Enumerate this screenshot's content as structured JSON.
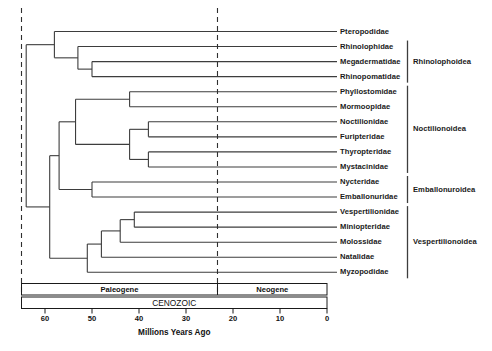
{
  "figure": {
    "axis_title": "Millions Years Ago",
    "era_label": "CENOZOIC",
    "epochs": [
      {
        "name": "Paleogene",
        "start_mya": 65,
        "end_mya": 23.3
      },
      {
        "name": "Neogene",
        "start_mya": 23.3,
        "end_mya": 0
      }
    ],
    "tick_labels": [
      "60",
      "50",
      "40",
      "30",
      "20",
      "10",
      "0"
    ],
    "boundary_lines_mya": [
      65,
      23.3
    ]
  },
  "taxa": [
    {
      "name": "Pteropodidae",
      "clade": ""
    },
    {
      "name": "Rhinolophidae",
      "clade": "Rhinolophoidea"
    },
    {
      "name": "Megadermatidae",
      "clade": "Rhinolophoidea"
    },
    {
      "name": "Rhinopomatidae",
      "clade": "Rhinolophoidea"
    },
    {
      "name": "Phyllostomidae",
      "clade": "Noctilionoidea"
    },
    {
      "name": "Mormoopidae",
      "clade": "Noctilionoidea"
    },
    {
      "name": "Noctilionidae",
      "clade": "Noctilionoidea"
    },
    {
      "name": "Furipteridae",
      "clade": "Noctilionoidea"
    },
    {
      "name": "Thyropteridae",
      "clade": "Noctilionoidea"
    },
    {
      "name": "Mystacinidae",
      "clade": "Noctilionoidea"
    },
    {
      "name": "Nycteridae",
      "clade": "Emballonuroidea"
    },
    {
      "name": "Emballonuridae",
      "clade": "Emballonuroidea"
    },
    {
      "name": "Vespertilionidae",
      "clade": "Vespertilionoidea"
    },
    {
      "name": "Miniopteridae",
      "clade": "Vespertilionoidea"
    },
    {
      "name": "Molossidae",
      "clade": "Vespertilionoidea"
    },
    {
      "name": "Natalidae",
      "clade": "Vespertilionoidea"
    },
    {
      "name": "Myzopodidae",
      "clade": "Vespertilionoidea"
    }
  ],
  "clades": [
    {
      "label": "Rhinolophoidea",
      "first_taxon": 1,
      "last_taxon": 3
    },
    {
      "label": "Noctilionoidea",
      "first_taxon": 4,
      "last_taxon": 9
    },
    {
      "label": "Emballonuroidea",
      "first_taxon": 10,
      "last_taxon": 11
    },
    {
      "label": "Vespertilionoidea",
      "first_taxon": 12,
      "last_taxon": 16
    }
  ],
  "chart_data": {
    "type": "diagram",
    "title": "",
    "xlabel": "Millions Years Ago",
    "xlim": [
      65,
      0
    ],
    "tick_values": [
      60,
      50,
      40,
      30,
      20,
      10,
      0
    ],
    "tree_nodes": [
      {
        "id": "root",
        "age_mya": 64.0,
        "children": [
          "nA",
          "nB"
        ]
      },
      {
        "id": "nA",
        "age_mya": 58.0,
        "children": [
          "Pteropodidae",
          "nA2"
        ]
      },
      {
        "id": "nA2",
        "age_mya": 53.0,
        "children": [
          "Rhinolophidae",
          "nA3"
        ]
      },
      {
        "id": "nA3",
        "age_mya": 50.0,
        "children": [
          "Megadermatidae",
          "Rhinopomatidae"
        ]
      },
      {
        "id": "nB",
        "age_mya": 59.0,
        "children": [
          "nC",
          "nV"
        ]
      },
      {
        "id": "nC",
        "age_mya": 57.0,
        "children": [
          "nD",
          "nE"
        ]
      },
      {
        "id": "nD",
        "age_mya": 53.5,
        "children": [
          "nF",
          "nG"
        ]
      },
      {
        "id": "nF",
        "age_mya": 42.0,
        "children": [
          "Phyllostomidae",
          "Mormoopidae"
        ]
      },
      {
        "id": "nG",
        "age_mya": 42.0,
        "children": [
          "nH",
          "nI"
        ]
      },
      {
        "id": "nH",
        "age_mya": 38.0,
        "children": [
          "Noctilionidae",
          "Furipteridae"
        ]
      },
      {
        "id": "nI",
        "age_mya": 38.0,
        "children": [
          "Thyropteridae",
          "Mystacinidae"
        ]
      },
      {
        "id": "nE",
        "age_mya": 50.0,
        "children": [
          "Nycteridae",
          "Emballonuridae"
        ]
      },
      {
        "id": "nV",
        "age_mya": 51.0,
        "children": [
          "nW",
          "Myzopodidae"
        ]
      },
      {
        "id": "nW",
        "age_mya": 48.0,
        "children": [
          "nX",
          "Natalidae"
        ]
      },
      {
        "id": "nX",
        "age_mya": 44.0,
        "children": [
          "nY",
          "Molossidae"
        ]
      },
      {
        "id": "nY",
        "age_mya": 41.0,
        "children": [
          "Vespertilionidae",
          "Miniopteridae"
        ]
      }
    ]
  }
}
